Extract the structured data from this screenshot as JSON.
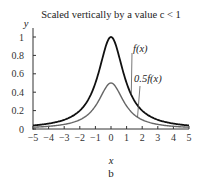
{
  "chart_data": {
    "type": "line",
    "title": "Scaled vertically by a value c < 1",
    "xlabel": "x",
    "ylabel": "y",
    "subfigure_label": "b",
    "xlim": [
      -5,
      5
    ],
    "ylim": [
      0,
      1.05
    ],
    "x_ticks": [
      -5,
      -4,
      -3,
      -2,
      -1,
      0,
      1,
      2,
      3,
      4,
      5
    ],
    "y_ticks": [
      0,
      0.2,
      0.4,
      0.6,
      0.8,
      1
    ],
    "y_tick_labels": [
      "0",
      "0.2",
      "0.4",
      "0.6",
      "0.8",
      "1"
    ],
    "x_tick_labels": [
      "−5",
      "−4",
      "−3",
      "−2",
      "−1",
      "0",
      "1",
      "2",
      "3",
      "4",
      "5"
    ],
    "grid": false,
    "series": [
      {
        "name": "f(x)",
        "color": "#111111",
        "x": [
          -5,
          -4,
          -3,
          -2,
          -1,
          -0.5,
          0,
          0.5,
          1,
          2,
          3,
          4,
          5
        ],
        "values": [
          0.038,
          0.059,
          0.1,
          0.2,
          0.5,
          0.8,
          1.0,
          0.8,
          0.5,
          0.2,
          0.1,
          0.059,
          0.038
        ]
      },
      {
        "name": "0.5f(x)",
        "color": "#666666",
        "x": [
          -5,
          -4,
          -3,
          -2,
          -1,
          -0.5,
          0,
          0.5,
          1,
          2,
          3,
          4,
          5
        ],
        "values": [
          0.019,
          0.029,
          0.05,
          0.1,
          0.25,
          0.4,
          0.5,
          0.4,
          0.25,
          0.1,
          0.05,
          0.029,
          0.019
        ]
      }
    ],
    "annotations": [
      {
        "text": "f(x)",
        "points_to": "f(x) curve at x≈1.2"
      },
      {
        "text": "0.5f(x)",
        "points_to": "0.5f(x) curve at x≈1.5"
      }
    ]
  }
}
